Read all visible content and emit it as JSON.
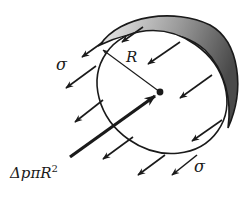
{
  "figure": {
    "labels": {
      "radius": "R",
      "stress_top": "σ",
      "stress_bottom": "σ",
      "pressure_force_main": "ΔpπR",
      "pressure_force_exp": "2"
    },
    "colors": {
      "stroke": "#1a1a1a",
      "shade_dark": "#5a5a5a",
      "shade_light": "#e8e8e8",
      "background": "#ffffff"
    }
  }
}
